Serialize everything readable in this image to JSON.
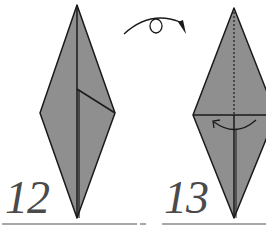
{
  "diagram": {
    "type": "origami-instructions",
    "colors": {
      "paper": "#8f8f8f",
      "line": "#1a1a1a",
      "rule": "#8a8a8a",
      "number": "#4a4a4a"
    },
    "steps": [
      {
        "number": "12",
        "description": "Kite/diamond base with flap fold line on right side"
      },
      {
        "number": "13",
        "description": "Turn model over; fold along horizontal line",
        "symbols": [
          "turn-over-arrow",
          "fold-arrow",
          "valley-fold-dotted-line"
        ]
      }
    ]
  }
}
